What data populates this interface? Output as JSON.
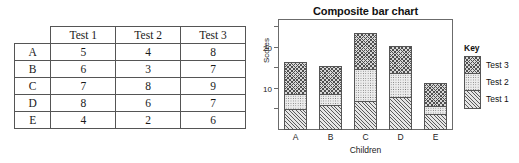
{
  "table": {
    "corner_label": "",
    "columns": [
      "Test 1",
      "Test 2",
      "Test 3"
    ],
    "rows": [
      {
        "label": "A",
        "values": [
          "5",
          "4",
          "8"
        ]
      },
      {
        "label": "B",
        "values": [
          "6",
          "3",
          "7"
        ]
      },
      {
        "label": "C",
        "values": [
          "7",
          "8",
          "9"
        ]
      },
      {
        "label": "D",
        "values": [
          "8",
          "6",
          "7"
        ]
      },
      {
        "label": "E",
        "values": [
          "4",
          "2",
          "6"
        ]
      }
    ]
  },
  "legend": {
    "title": "Key",
    "entries": [
      {
        "label": "Test 3",
        "pattern": "cross-hatch"
      },
      {
        "label": "Test 2",
        "pattern": "dotted"
      },
      {
        "label": "Test 1",
        "pattern": "diagonal-hatch"
      }
    ]
  },
  "chart_data": {
    "type": "bar",
    "subtype": "stacked",
    "title": "Composite bar chart",
    "xlabel": "Children",
    "ylabel": "Scores",
    "categories": [
      "A",
      "B",
      "C",
      "D",
      "E"
    ],
    "series": [
      {
        "name": "Test 1",
        "values": [
          5,
          6,
          7,
          8,
          4
        ]
      },
      {
        "name": "Test 2",
        "values": [
          4,
          3,
          8,
          6,
          2
        ]
      },
      {
        "name": "Test 3",
        "values": [
          8,
          7,
          9,
          7,
          6
        ]
      }
    ],
    "totals": [
      17,
      16,
      24,
      21,
      12
    ],
    "ylim": [
      0,
      27
    ],
    "yticks": [
      5,
      10,
      15,
      20,
      25
    ],
    "ytick_labels": [
      "",
      "10",
      "",
      "20",
      ""
    ],
    "grid": false,
    "legend_position": "right"
  }
}
